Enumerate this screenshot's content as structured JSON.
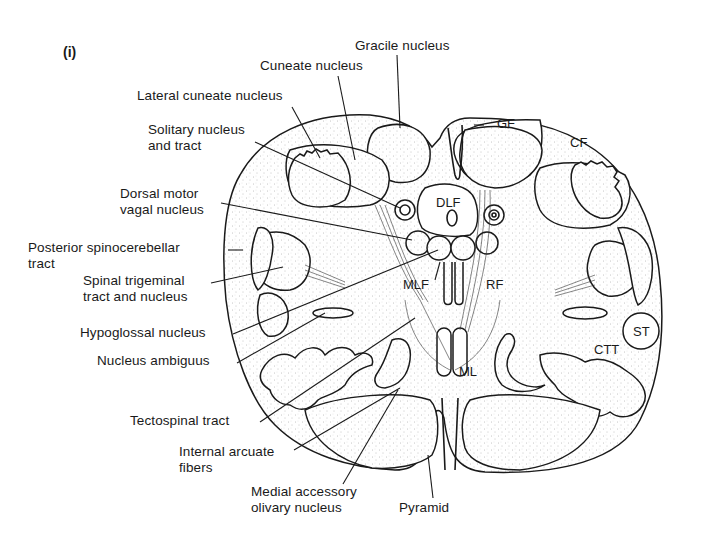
{
  "figure": {
    "panel_label": "(i)",
    "colors": {
      "ink": "#1a1a1a",
      "background": "#ffffff",
      "stipple": "#9a9a9a"
    }
  },
  "labels": {
    "gracile_nucleus": "Gracile nucleus",
    "cuneate_nucleus": "Cuneate nucleus",
    "lateral_cuneate_nucleus": "Lateral cuneate nucleus",
    "solitary_nucleus": "Solitary nucleus\nand tract",
    "dorsal_motor_vagal": "Dorsal motor\nvagal nucleus",
    "posterior_spinocerebellar": "Posterior spinocerebellar\ntract",
    "spinal_trigeminal": "Spinal trigeminal\ntract and nucleus",
    "hypoglossal_nucleus": "Hypoglossal nucleus",
    "nucleus_ambiguus": "Nucleus ambiguus",
    "tectospinal_tract": "Tectospinal tract",
    "internal_arcuate": "Internal arcuate\nfibers",
    "medial_accessory_olivary": "Medial accessory\nolivary nucleus",
    "pyramid": "Pyramid"
  },
  "inner_labels": {
    "GF": "GF",
    "CF": "CF",
    "DLF": "DLF",
    "MLF": "MLF",
    "RF": "RF",
    "ST": "ST",
    "CTT": "CTT",
    "ML": "ML"
  }
}
